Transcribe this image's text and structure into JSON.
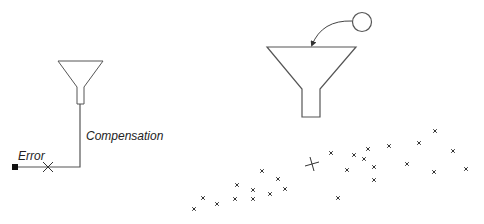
{
  "labels": {
    "error": "Error",
    "compensation": "Compensation"
  },
  "colors": {
    "stroke": "#555555",
    "marker": "#333333",
    "text": "#222222",
    "background": "#ffffff"
  },
  "left_funnel": {
    "top_left": [
      58,
      61
    ],
    "top_right": [
      103,
      61
    ],
    "neck_left": [
      77,
      87
    ],
    "neck_right": [
      84,
      87
    ],
    "stem_bottom_y": 104
  },
  "left_path": {
    "start_square_center": [
      15,
      167
    ],
    "corner": [
      80,
      167
    ],
    "top": [
      80,
      104
    ],
    "x_marker": [
      48,
      167
    ]
  },
  "right_funnel": {
    "top_left": [
      267,
      47
    ],
    "top_right": [
      356,
      47
    ],
    "neck_left": [
      302,
      89
    ],
    "neck_right": [
      320,
      89
    ],
    "stem_bottom_y": 117
  },
  "ball": {
    "cx": 362,
    "cy": 22,
    "r": 9.5
  },
  "arrow": {
    "from": [
      352,
      21
    ],
    "control": [
      322,
      20
    ],
    "to": [
      312,
      45
    ]
  },
  "big_cross": [
    312,
    164
  ],
  "scatter_points": [
    [
      194,
      209
    ],
    [
      203,
      198
    ],
    [
      217,
      204
    ],
    [
      235,
      199
    ],
    [
      237,
      185
    ],
    [
      253,
      190
    ],
    [
      253,
      199
    ],
    [
      262,
      171
    ],
    [
      270,
      194
    ],
    [
      278,
      179
    ],
    [
      285,
      189
    ],
    [
      331,
      153
    ],
    [
      338,
      198
    ],
    [
      347,
      170
    ],
    [
      354,
      155
    ],
    [
      364,
      159
    ],
    [
      368,
      149
    ],
    [
      374,
      167
    ],
    [
      374,
      180
    ],
    [
      389,
      146
    ],
    [
      407,
      164
    ],
    [
      419,
      143
    ],
    [
      435,
      131
    ],
    [
      434,
      172
    ],
    [
      453,
      151
    ],
    [
      466,
      169
    ]
  ]
}
